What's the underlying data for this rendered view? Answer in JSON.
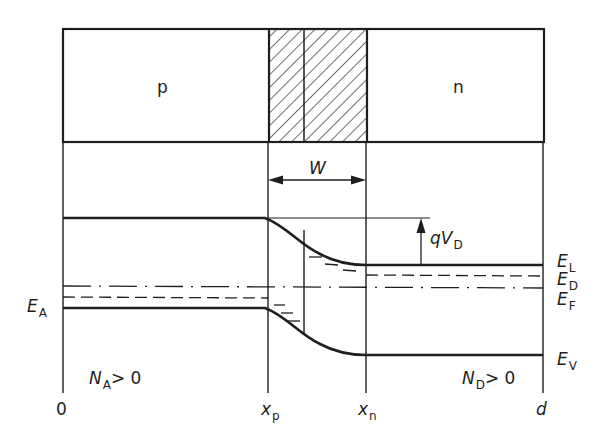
{
  "figure": {
    "regions": {
      "p_label": "p",
      "n_label": "n",
      "depletion_width_label": "W"
    },
    "energy_labels": {
      "conduction_band": "E",
      "conduction_band_sub": "L",
      "donor_level": "E",
      "donor_level_sub": "D",
      "fermi_level": "E",
      "fermi_level_sub": "F",
      "valence_band": "E",
      "valence_band_sub": "V",
      "acceptor_level": "E",
      "acceptor_level_sub": "A"
    },
    "barrier_label": {
      "prefix": "qV",
      "sub": "D"
    },
    "doping_labels": {
      "p_side": {
        "main": "N",
        "sub": "A",
        "rest": "> 0"
      },
      "n_side": {
        "main": "N",
        "sub": "D",
        "rest": "> 0"
      }
    },
    "x_axis_labels": {
      "origin": "0",
      "xp": "x",
      "xp_sub": "p",
      "xn": "x",
      "xn_sub": "n",
      "end": "d"
    },
    "colors": {
      "ink": "#1e1e1e",
      "background": "#ffffff"
    }
  }
}
